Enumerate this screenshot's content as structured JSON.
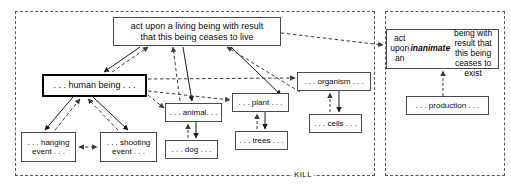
{
  "diagram": {
    "canvas": {
      "width": 511,
      "height": 190
    },
    "colors": {
      "node_border": "#4a4a4a",
      "emphasis_border": "#000000",
      "region_border": "#555555",
      "edge_solid": "#1a1a1a",
      "edge_dashed": "#3a3a3a",
      "background": "#ffffff",
      "text": "#0a0a0a"
    },
    "regions": [
      {
        "id": "kill-region",
        "label": "KILL",
        "x": 15,
        "y": 11,
        "w": 360,
        "h": 165
      },
      {
        "id": "inanimate-region",
        "label": "",
        "x": 385,
        "y": 11,
        "w": 120,
        "h": 165
      }
    ],
    "region_label": "KILL",
    "nodes": [
      {
        "id": "act-living",
        "text": "act upon a living being with result\nthat this being ceases to live",
        "x": 113,
        "y": 17,
        "w": 168,
        "h": 29,
        "font_size": 9,
        "emphasis": false
      },
      {
        "id": "act-inanimate",
        "text_pre": "act upon an ",
        "text_bold": "inanimate",
        "text_post": "\nbeing with result that\nthis being ceases to exist",
        "text": "act upon an inanimate\nbeing with result that\nthis being ceases to exist",
        "x": 386,
        "y": 29,
        "w": 113,
        "h": 40,
        "font_size": 8.5,
        "emphasis": false
      },
      {
        "id": "human-being",
        "text": ". . . human being . . .",
        "x": 42,
        "y": 74,
        "w": 105,
        "h": 23,
        "font_size": 9,
        "emphasis": true
      },
      {
        "id": "animal",
        "text": ". . . animal. . .",
        "x": 165,
        "y": 103,
        "w": 57,
        "h": 19,
        "font_size": 8,
        "emphasis": false
      },
      {
        "id": "plant",
        "text": ". . . plant . . .",
        "x": 232,
        "y": 93,
        "w": 57,
        "h": 19,
        "font_size": 8,
        "emphasis": false
      },
      {
        "id": "organism",
        "text": ". . . organism . . .",
        "x": 297,
        "y": 72,
        "w": 74,
        "h": 19,
        "font_size": 8,
        "emphasis": false
      },
      {
        "id": "cells",
        "text": ". . . cells . . .",
        "x": 309,
        "y": 114,
        "w": 53,
        "h": 19,
        "font_size": 8,
        "emphasis": false
      },
      {
        "id": "trees",
        "text": ". . . trees . . .",
        "x": 235,
        "y": 131,
        "w": 53,
        "h": 19,
        "font_size": 8,
        "emphasis": false
      },
      {
        "id": "dog",
        "text": ". . . dog . . .",
        "x": 165,
        "y": 140,
        "w": 53,
        "h": 19,
        "font_size": 8,
        "emphasis": false
      },
      {
        "id": "hanging-event",
        "text": ". . . hanging\nevent . . .",
        "x": 21,
        "y": 132,
        "w": 55,
        "h": 30,
        "font_size": 8,
        "emphasis": false
      },
      {
        "id": "shooting-event",
        "text": ". . . shooting\nevent . . .",
        "x": 100,
        "y": 132,
        "w": 57,
        "h": 30,
        "font_size": 8,
        "emphasis": false
      },
      {
        "id": "production",
        "text": ". . . production . . .",
        "x": 406,
        "y": 96,
        "w": 83,
        "h": 19,
        "font_size": 8,
        "emphasis": false
      }
    ],
    "edges": [
      {
        "id": "e-actliving-human",
        "from": "act-living",
        "to": "human-being",
        "style": "solid",
        "arrow": "to"
      },
      {
        "id": "e-human-actliving",
        "from": "human-being",
        "to": "act-living",
        "style": "dashed",
        "arrow": "to"
      },
      {
        "id": "e-actliving-animal",
        "from": "act-living",
        "to": "animal",
        "style": "solid",
        "arrow": "to"
      },
      {
        "id": "e-animal-actliving",
        "from": "animal",
        "to": "act-living",
        "style": "dashed",
        "arrow": "to"
      },
      {
        "id": "e-actliving-organism",
        "from": "act-living",
        "to": "organism",
        "style": "solid",
        "arrow": "to"
      },
      {
        "id": "e-organism-actliving",
        "from": "organism",
        "to": "act-living",
        "style": "dashed",
        "arrow": "to"
      },
      {
        "id": "e-actliving-actinanimate",
        "from": "act-living",
        "to": "act-inanimate",
        "style": "dashed",
        "arrow": "to"
      },
      {
        "id": "e-human-organism",
        "from": "human-being",
        "to": "organism",
        "style": "dashed",
        "arrow": "to"
      },
      {
        "id": "e-human-plant",
        "from": "human-being",
        "to": "plant",
        "style": "dashed",
        "arrow": "to"
      },
      {
        "id": "e-human-animal",
        "from": "human-being",
        "to": "animal",
        "style": "dashed",
        "arrow": "to"
      },
      {
        "id": "e-human-hanging",
        "from": "human-being",
        "to": "hanging-event",
        "style": "solid",
        "arrow": "to"
      },
      {
        "id": "e-hanging-human",
        "from": "hanging-event",
        "to": "human-being",
        "style": "dashed",
        "arrow": "to"
      },
      {
        "id": "e-human-shooting",
        "from": "human-being",
        "to": "shooting-event",
        "style": "solid",
        "arrow": "to"
      },
      {
        "id": "e-shooting-human",
        "from": "shooting-event",
        "to": "human-being",
        "style": "dashed",
        "arrow": "to"
      },
      {
        "id": "e-hanging-shooting",
        "from": "hanging-event",
        "to": "shooting-event",
        "style": "dashed",
        "arrow": "both"
      },
      {
        "id": "e-animal-dog",
        "from": "animal",
        "to": "dog",
        "style": "solid",
        "arrow": "to"
      },
      {
        "id": "e-dog-animal",
        "from": "dog",
        "to": "animal",
        "style": "dashed",
        "arrow": "to"
      },
      {
        "id": "e-plant-trees",
        "from": "plant",
        "to": "trees",
        "style": "solid",
        "arrow": "to"
      },
      {
        "id": "e-trees-plant",
        "from": "trees",
        "to": "plant",
        "style": "dashed",
        "arrow": "to"
      },
      {
        "id": "e-organism-cells",
        "from": "organism",
        "to": "cells",
        "style": "solid",
        "arrow": "to"
      },
      {
        "id": "e-cells-organism",
        "from": "cells",
        "to": "organism",
        "style": "dashed",
        "arrow": "to"
      },
      {
        "id": "e-production-actinanimate",
        "from": "production",
        "to": "act-inanimate",
        "style": "dashed",
        "arrow": "to"
      }
    ]
  }
}
